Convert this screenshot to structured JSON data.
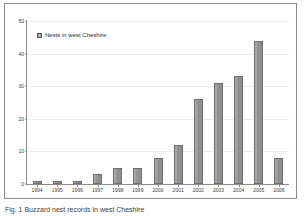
{
  "figure": {
    "caption": "Fig. 1  Buzzard nest records in west Cheshire"
  },
  "legend": {
    "swatch_icon": "legend-square-icon",
    "label": "Nests in west Cheshire",
    "position": "top-left-inside"
  },
  "axes": {
    "y_ticks": [
      "0",
      "10",
      "20",
      "30",
      "40",
      "50"
    ],
    "x_ticks": [
      "1994",
      "1995",
      "1996",
      "1997",
      "1998",
      "1999",
      "2000",
      "2001",
      "2002",
      "2003",
      "2004",
      "2005",
      "2006"
    ]
  },
  "colors": {
    "bar_fill": "#949494",
    "bar_edge": "#6e6e6e",
    "axis": "#8c8c8c",
    "gridline": "#ededed",
    "frame": "#8a8a8a",
    "text": "#3b3b3b",
    "background": "#ffffff"
  },
  "chart_data": {
    "type": "bar",
    "title": "",
    "subtitle": "",
    "xlabel": "",
    "ylabel": "",
    "categories": [
      "1994",
      "1995",
      "1996",
      "1997",
      "1998",
      "1999",
      "2000",
      "2001",
      "2002",
      "2003",
      "2004",
      "2005",
      "2006"
    ],
    "values": [
      1,
      1,
      1,
      3,
      5,
      5,
      8,
      12,
      26,
      31,
      33,
      44,
      8
    ],
    "series": [
      {
        "name": "Nests in west Cheshire",
        "values": [
          1,
          1,
          1,
          3,
          5,
          5,
          8,
          12,
          26,
          31,
          33,
          44,
          8
        ]
      }
    ],
    "ylim": [
      0,
      50
    ],
    "ytick_values": [
      0,
      10,
      20,
      30,
      40,
      50
    ],
    "grid": true,
    "grid_axis": "y",
    "legend": true,
    "legend_position": "upper left"
  }
}
